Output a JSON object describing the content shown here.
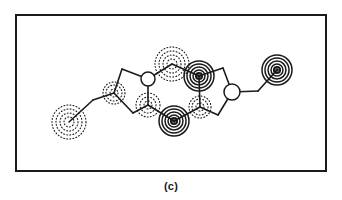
{
  "figure": {
    "caption": "(c)",
    "panel_id": "c",
    "type": "deformation-electron-density-map",
    "background_color": "#ffffff",
    "line_color": "#1a1a1a"
  },
  "frame": {
    "x": 15,
    "y": 14,
    "width": 312,
    "height": 158,
    "stroke_color": "#1a1a1a",
    "stroke_width": 2
  },
  "chart_data": {
    "type": "scatter",
    "title": "(c)",
    "xlabel": "",
    "ylabel": "",
    "xlim": [
      15,
      327
    ],
    "ylim": [
      14,
      172
    ],
    "grid": false,
    "legend": "none",
    "annotations": [
      "solid concentric contours = positive deformation density",
      "dotted concentric contours = negative deformation density",
      "open circles = ring vertex atoms without contour features"
    ],
    "skeleton_nodes": [
      {
        "id": "n1",
        "name": "left-terminal-atom",
        "x": 69,
        "y": 122,
        "marker": "contour-dashed"
      },
      {
        "id": "n2",
        "name": "left-methylene",
        "x": 93,
        "y": 100,
        "marker": "vertex"
      },
      {
        "id": "n3",
        "name": "left-ring-substituent",
        "x": 114,
        "y": 93,
        "marker": "contour-dashed"
      },
      {
        "id": "n4",
        "name": "left-ring-top",
        "x": 122,
        "y": 69,
        "marker": "vertex"
      },
      {
        "id": "n5",
        "name": "left-ring-bottom",
        "x": 133,
        "y": 113,
        "marker": "vertex"
      },
      {
        "id": "n6",
        "name": "ring-fusion-top-left",
        "x": 148,
        "y": 79,
        "marker": "circle-open"
      },
      {
        "id": "n7",
        "name": "ring-fusion-bottom-left",
        "x": 148,
        "y": 105,
        "marker": "contour-dashed"
      },
      {
        "id": "n8",
        "name": "bridge-top-atom",
        "x": 172,
        "y": 64,
        "marker": "contour-dashed"
      },
      {
        "id": "n9",
        "name": "bridge-bottom-atom",
        "x": 174,
        "y": 121,
        "marker": "contour-solid"
      },
      {
        "id": "n10",
        "name": "ring-fusion-top-right",
        "x": 199,
        "y": 76,
        "marker": "contour-solid"
      },
      {
        "id": "n11",
        "name": "ring-fusion-bottom-right",
        "x": 200,
        "y": 107,
        "marker": "contour-dashed"
      },
      {
        "id": "n12",
        "name": "right-ring-top",
        "x": 223,
        "y": 68,
        "marker": "vertex"
      },
      {
        "id": "n13",
        "name": "right-ring-bottom",
        "x": 218,
        "y": 115,
        "marker": "vertex"
      },
      {
        "id": "n14",
        "name": "right-ring-substituent",
        "x": 232,
        "y": 92,
        "marker": "circle-open"
      },
      {
        "id": "n15",
        "name": "right-methylene",
        "x": 258,
        "y": 91,
        "marker": "vertex"
      },
      {
        "id": "n16",
        "name": "right-terminal-atom",
        "x": 277,
        "y": 70,
        "marker": "contour-solid"
      }
    ],
    "skeleton_bonds": [
      {
        "from": "n1",
        "to": "n2"
      },
      {
        "from": "n2",
        "to": "n3"
      },
      {
        "from": "n3",
        "to": "n4"
      },
      {
        "from": "n3",
        "to": "n5"
      },
      {
        "from": "n4",
        "to": "n6"
      },
      {
        "from": "n5",
        "to": "n7"
      },
      {
        "from": "n6",
        "to": "n7"
      },
      {
        "from": "n6",
        "to": "n8"
      },
      {
        "from": "n7",
        "to": "n9"
      },
      {
        "from": "n8",
        "to": "n10"
      },
      {
        "from": "n9",
        "to": "n11"
      },
      {
        "from": "n10",
        "to": "n11"
      },
      {
        "from": "n10",
        "to": "n12"
      },
      {
        "from": "n11",
        "to": "n13"
      },
      {
        "from": "n12",
        "to": "n14"
      },
      {
        "from": "n13",
        "to": "n14"
      },
      {
        "from": "n14",
        "to": "n15"
      },
      {
        "from": "n15",
        "to": "n16"
      }
    ],
    "contour_features": [
      {
        "name": "left-terminal-negative-lobe",
        "x": 69,
        "y": 122,
        "style": "dashed",
        "radii": [
          5,
          9,
          13,
          17
        ],
        "peak_sign": "negative"
      },
      {
        "name": "left-substituent-negative-lobe",
        "x": 114,
        "y": 93,
        "style": "dashed",
        "radii": [
          4,
          8,
          11
        ],
        "peak_sign": "negative"
      },
      {
        "name": "bridge-top-negative-lobe",
        "x": 172,
        "y": 64,
        "style": "dashed",
        "radii": [
          5,
          9,
          13,
          17
        ],
        "peak_sign": "negative"
      },
      {
        "name": "fusion-bottom-left-negative-lobe",
        "x": 148,
        "y": 105,
        "style": "dashed",
        "radii": [
          4,
          8,
          12
        ],
        "peak_sign": "negative"
      },
      {
        "name": "fusion-bottom-right-negative-lobe",
        "x": 200,
        "y": 107,
        "style": "dashed",
        "radii": [
          4,
          8,
          11
        ],
        "peak_sign": "negative"
      },
      {
        "name": "bridge-bottom-positive-peak",
        "x": 174,
        "y": 121,
        "style": "solid",
        "radii": [
          3,
          6,
          9,
          12,
          15
        ],
        "peak_sign": "positive"
      },
      {
        "name": "fusion-top-right-positive-peak",
        "x": 199,
        "y": 76,
        "style": "solid",
        "radii": [
          3,
          6,
          9,
          12,
          15
        ],
        "peak_sign": "positive"
      },
      {
        "name": "right-terminal-positive-peak",
        "x": 277,
        "y": 70,
        "style": "solid",
        "radii": [
          3,
          6,
          9,
          12,
          15
        ],
        "peak_sign": "positive"
      }
    ],
    "open_circle_atoms": [
      {
        "name": "ring-fusion-top-left-open-circle",
        "x": 148,
        "y": 79,
        "r": 7
      },
      {
        "name": "right-ring-substituent-open-circle",
        "x": 232,
        "y": 92,
        "r": 8
      }
    ]
  }
}
